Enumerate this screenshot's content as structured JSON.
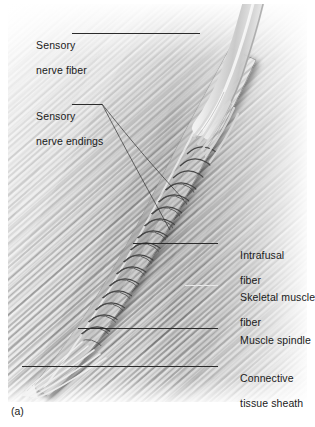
{
  "figure": {
    "caption": "(a)",
    "alt_title": "Muscle spindle with sensory nerve fiber and intrafusal fibers",
    "background_color": "#ffffff",
    "ink_color": "#1a1a1a",
    "leader_color": "#2b2b2b"
  },
  "labels": [
    {
      "id": "sensory-nerve-fiber",
      "line1": "Sensory",
      "line2": "nerve fiber"
    },
    {
      "id": "sensory-nerve-endings",
      "line1": "Sensory",
      "line2": "nerve endings"
    },
    {
      "id": "intrafusal-fiber",
      "line1": "Intrafusal",
      "line2": "fiber"
    },
    {
      "id": "skeletal-muscle-fiber",
      "line1": "Skeletal muscle",
      "line2": "fiber"
    },
    {
      "id": "muscle-spindle",
      "line1": "Muscle spindle",
      "line2": ""
    },
    {
      "id": "connective-tissue-sheath",
      "line1": "Connective",
      "line2": "tissue sheath"
    }
  ]
}
